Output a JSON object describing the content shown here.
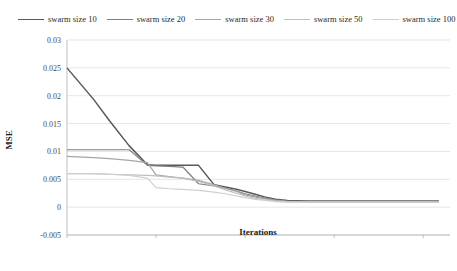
{
  "chart_data": {
    "type": "line",
    "title": "",
    "xlabel": "Iterations",
    "ylabel": "MSE",
    "xscale": "log",
    "xlim": [
      1,
      20000
    ],
    "ylim": [
      -0.005,
      0.03
    ],
    "ytick_labels": [
      "0.03",
      "0.025",
      "0.02",
      "0.015",
      "0.01",
      "0.005",
      "0",
      "-0.005"
    ],
    "ytick_values": [
      0.03,
      0.025,
      0.02,
      0.015,
      0.01,
      0.005,
      0,
      -0.005
    ],
    "xtick_labels": [
      "1",
      "10",
      "100",
      "1000",
      "10000"
    ],
    "xtick_values": [
      1,
      10,
      100,
      1000,
      10000
    ],
    "grid": "horizontal",
    "legend_position": "top",
    "series": [
      {
        "name": "swarm size 10",
        "color": "#595959",
        "x": [
          1,
          2,
          3,
          5,
          8,
          10,
          14,
          20,
          30,
          45,
          60,
          80,
          100,
          130,
          170,
          220,
          300,
          500,
          1000,
          3000,
          10000,
          15000
        ],
        "values": [
          0.025,
          0.0193,
          0.0155,
          0.011,
          0.0076,
          0.0075,
          0.0075,
          0.0075,
          0.0075,
          0.004,
          0.0036,
          0.0032,
          0.0028,
          0.0023,
          0.0018,
          0.0014,
          0.0012,
          0.0011,
          0.0011,
          0.0011,
          0.0011,
          0.0011
        ]
      },
      {
        "name": "swarm size 20",
        "color": "#7f7f7f",
        "x": [
          1,
          2,
          3,
          5,
          8,
          10,
          14,
          20,
          30,
          45,
          60,
          80,
          100,
          130,
          170,
          220,
          300,
          500,
          1000,
          3000,
          10000,
          15000
        ],
        "values": [
          0.0103,
          0.0103,
          0.0103,
          0.0103,
          0.0075,
          0.0074,
          0.0073,
          0.0072,
          0.0042,
          0.0038,
          0.0034,
          0.0029,
          0.0024,
          0.002,
          0.0016,
          0.0013,
          0.0011,
          0.001,
          0.001,
          0.001,
          0.001,
          0.001
        ]
      },
      {
        "name": "swarm size 30",
        "color": "#a6a6a6",
        "x": [
          1,
          2,
          3,
          5,
          8,
          10,
          14,
          20,
          30,
          45,
          60,
          80,
          100,
          130,
          170,
          220,
          300,
          500,
          1000,
          3000,
          10000,
          15000
        ],
        "values": [
          0.0091,
          0.0089,
          0.0087,
          0.0084,
          0.008,
          0.0058,
          0.0055,
          0.0052,
          0.0048,
          0.004,
          0.0034,
          0.0028,
          0.0022,
          0.0018,
          0.0015,
          0.0012,
          0.001,
          0.001,
          0.001,
          0.001,
          0.001,
          0.001
        ]
      },
      {
        "name": "swarm size 50",
        "color": "#bfbfbf",
        "x": [
          1,
          2,
          3,
          5,
          8,
          10,
          14,
          20,
          30,
          45,
          60,
          80,
          100,
          130,
          170,
          220,
          300,
          500,
          1000,
          3000,
          10000,
          15000
        ],
        "values": [
          0.006,
          0.006,
          0.0059,
          0.0058,
          0.0057,
          0.0056,
          0.0054,
          0.0052,
          0.0046,
          0.0038,
          0.0031,
          0.0025,
          0.002,
          0.0016,
          0.0013,
          0.0011,
          0.001,
          0.0009,
          0.0009,
          0.0009,
          0.0009,
          0.0009
        ]
      },
      {
        "name": "swarm size 100",
        "color": "#cfcfcf",
        "x": [
          1,
          2,
          3,
          5,
          8,
          10,
          14,
          20,
          30,
          45,
          60,
          80,
          100,
          130,
          170,
          220,
          300,
          500,
          1000,
          3000,
          10000,
          15000
        ],
        "values": [
          0.006,
          0.006,
          0.0059,
          0.0057,
          0.0052,
          0.0035,
          0.0033,
          0.0032,
          0.003,
          0.0027,
          0.0024,
          0.002,
          0.0017,
          0.0014,
          0.0012,
          0.001,
          0.0009,
          0.0009,
          0.0009,
          0.0009,
          0.0009,
          0.0009
        ]
      }
    ]
  }
}
